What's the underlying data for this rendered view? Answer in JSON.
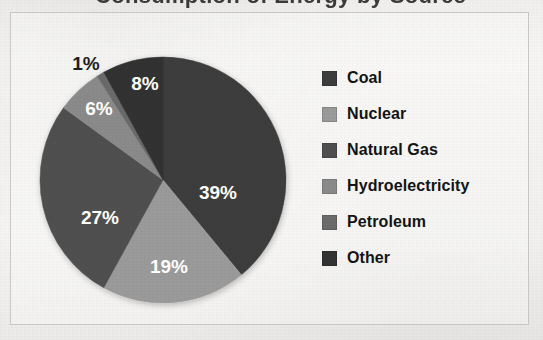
{
  "title_fragment": "Consumption of Energy by Source",
  "frame": {
    "border_color": "#c9c9c9",
    "background": "#ffffff"
  },
  "chart_data": {
    "type": "pie",
    "title": "Consumption of Energy by Source",
    "xlabel": "",
    "ylabel": "",
    "legend_position": "right",
    "grid": false,
    "start_angle_deg": 0,
    "direction": "clockwise",
    "units": "percent",
    "categories": [
      "Coal",
      "Nuclear",
      "Natural Gas",
      "Hydroelectricity",
      "Petroleum",
      "Other"
    ],
    "values": [
      39,
      19,
      27,
      6,
      1,
      8
    ],
    "labels": [
      "39%",
      "19%",
      "27%",
      "6%",
      "1%",
      "8%"
    ],
    "colors": [
      "#3d3d3d",
      "#9a9a9a",
      "#4f4f4f",
      "#8a8a8a",
      "#6b6b6b",
      "#333333"
    ],
    "label_colors": [
      "#ffffff",
      "#ffffff",
      "#ffffff",
      "#ffffff",
      "#1d1d1d",
      "#ffffff"
    ],
    "label_placement": [
      "inside",
      "inside",
      "inside",
      "inside",
      "outside",
      "inside"
    ],
    "slices": [
      {
        "name": "Coal",
        "value": 39,
        "label": "39%",
        "color": "#3d3d3d",
        "label_color": "#ffffff",
        "placement": "inside",
        "label_x": 218,
        "label_y": 194
      },
      {
        "name": "Nuclear",
        "value": 19,
        "label": "19%",
        "color": "#9a9a9a",
        "label_color": "#ffffff",
        "placement": "inside",
        "label_x": 169,
        "label_y": 268
      },
      {
        "name": "Natural Gas",
        "value": 27,
        "label": "27%",
        "color": "#4f4f4f",
        "label_color": "#ffffff",
        "placement": "inside",
        "label_x": 100,
        "label_y": 219
      },
      {
        "name": "Hydroelectricity",
        "value": 6,
        "label": "6%",
        "color": "#8a8a8a",
        "label_color": "#ffffff",
        "placement": "inside",
        "label_x": 99,
        "label_y": 110
      },
      {
        "name": "Petroleum",
        "value": 1,
        "label": "1%",
        "color": "#6b6b6b",
        "label_color": "#1d1d1d",
        "placement": "outside",
        "label_x": 86,
        "label_y": 65
      },
      {
        "name": "Other",
        "value": 8,
        "label": "8%",
        "color": "#333333",
        "label_color": "#ffffff",
        "placement": "inside",
        "label_x": 145,
        "label_y": 85
      }
    ],
    "geometry": {
      "cx": 163,
      "cy": 180,
      "r": 123
    }
  },
  "legend": {
    "items": [
      {
        "label": "Coal",
        "color": "#3d3d3d"
      },
      {
        "label": "Nuclear",
        "color": "#9a9a9a"
      },
      {
        "label": "Natural Gas",
        "color": "#4f4f4f"
      },
      {
        "label": "Hydroelectricity",
        "color": "#8a8a8a"
      },
      {
        "label": "Petroleum",
        "color": "#6b6b6b"
      },
      {
        "label": "Other",
        "color": "#333333"
      }
    ]
  }
}
